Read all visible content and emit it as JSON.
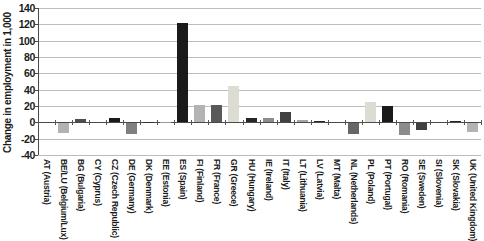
{
  "chart_data": {
    "type": "bar",
    "title": "",
    "xlabel": "",
    "ylabel": "Change in employment in 1,000",
    "ylim": [
      -40,
      140
    ],
    "yticks": [
      140,
      120,
      100,
      80,
      60,
      40,
      20,
      0,
      -20,
      -40
    ],
    "grid": true,
    "legend": false,
    "categories": [
      "AT (Austria)",
      "BE/LU (Belgium/Lux)",
      "BG (Bulgaria)",
      "CY (Cyprus)",
      "CZ (Czech Republic)",
      "DE (Germany)",
      "DK (Denmark)",
      "EE (Estonia)",
      "ES (Spain)",
      "FI (Finland)",
      "FR (France)",
      "GR (Greece)",
      "HU (Hungary)",
      "IE (Ireland)",
      "IT (Italy)",
      "LT (Lithuania)",
      "LV (Latvia)",
      "MT (Malta)",
      "NL (Netherlands)",
      "PL (Poland)",
      "PT (Portugal)",
      "RO (Romania)",
      "SE (Sweden)",
      "SI (Slovenia)",
      "SK (Slovakia)",
      "UK (United Kingdom)"
    ],
    "values": [
      0,
      -12,
      4,
      0,
      5,
      -13,
      1,
      1,
      122,
      21,
      21,
      44,
      5,
      5,
      13,
      3,
      2,
      0,
      -13,
      25,
      20,
      -14,
      -8,
      0,
      2,
      -11
    ],
    "bar_colors": [
      "#999999",
      "#b3b3b3",
      "#4d4d4d",
      "#999999",
      "#1a1a1a",
      "#808080",
      "#333333",
      "#999999",
      "#1a1a1a",
      "#b3b3b3",
      "#595959",
      "#dcdcd2",
      "#262626",
      "#8c8c8c",
      "#404040",
      "#a6a6a6",
      "#262626",
      "#999999",
      "#666666",
      "#dcdcd2",
      "#1a1a1a",
      "#8c8c8c",
      "#404040",
      "#999999",
      "#262626",
      "#b3b3b3"
    ],
    "colors_meta": {
      "gridline": "#bcbcbc",
      "axis": "#4a4a4a",
      "background": "#ffffff",
      "text": "#1a1a1a"
    }
  }
}
